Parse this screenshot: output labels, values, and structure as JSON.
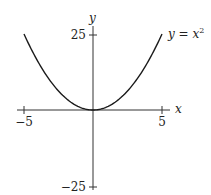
{
  "chart_data": {
    "type": "line",
    "title": "",
    "xlabel": "x",
    "ylabel": "y",
    "xlim": [
      -5,
      5
    ],
    "ylim": [
      -25,
      25
    ],
    "grid": false,
    "x_ticks": [
      -5,
      5
    ],
    "y_ticks": [
      -25,
      25
    ],
    "x_tick_labels": [
      "−5",
      "5"
    ],
    "y_tick_labels": [
      "−25",
      "25"
    ],
    "series": [
      {
        "name": "y = x^2",
        "function": "x^2",
        "x": [
          -5,
          -4,
          -3,
          -2,
          -1,
          0,
          1,
          2,
          3,
          4,
          5
        ],
        "y": [
          25,
          16,
          9,
          4,
          1,
          0,
          1,
          4,
          9,
          16,
          25
        ]
      }
    ],
    "annotations": [
      {
        "text": "y = x²",
        "position": "upper-right, at end of curve"
      }
    ]
  },
  "labels": {
    "x_axis": "x",
    "y_axis": "y",
    "x_min": "−5",
    "x_max": "5",
    "y_max": "25",
    "y_min": "−25",
    "curve_label_main": "y = x",
    "curve_label_exp": "2"
  },
  "colors": {
    "curve": "#1a1a1a",
    "axis": "#333333"
  }
}
